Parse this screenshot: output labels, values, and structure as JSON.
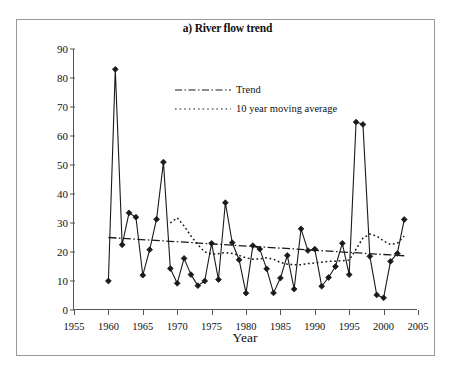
{
  "chart_data": {
    "type": "line",
    "title": "a) River flow trend",
    "xlabel": "Year",
    "ylabel_html": "River flows (m<sup>3</sup> s<sup>-1</sup>)",
    "ylabel": "River flows (m3 s-1)",
    "xlim": [
      1955,
      2005
    ],
    "ylim": [
      0,
      90
    ],
    "xticks": [
      1955,
      1960,
      1965,
      1970,
      1975,
      1980,
      1985,
      1990,
      1995,
      2000,
      2005
    ],
    "yticks": [
      0,
      10,
      20,
      30,
      40,
      50,
      60,
      70,
      80,
      90
    ],
    "grid": false,
    "legend_position": "upper-center",
    "legend": [
      {
        "label": "Trend",
        "style": "dash-dot"
      },
      {
        "label": "10 year moving average",
        "style": "dotted"
      }
    ],
    "series": [
      {
        "name": "River flows",
        "style": "solid-with-diamond-markers",
        "marker": "diamond",
        "x": [
          1960,
          1961,
          1962,
          1963,
          1964,
          1965,
          1966,
          1967,
          1968,
          1969,
          1970,
          1971,
          1972,
          1973,
          1974,
          1975,
          1976,
          1977,
          1978,
          1979,
          1980,
          1981,
          1982,
          1983,
          1984,
          1985,
          1986,
          1987,
          1988,
          1989,
          1990,
          1991,
          1992,
          1993,
          1994,
          1995,
          1996,
          1997,
          1998,
          1999,
          2000,
          2001,
          2002,
          2003
        ],
        "values": [
          10.0,
          83.0,
          22.5,
          33.5,
          32.0,
          12.0,
          20.8,
          31.3,
          51.0,
          14.3,
          9.2,
          17.8,
          12.2,
          8.4,
          10.0,
          23.0,
          10.5,
          37.0,
          23.2,
          17.3,
          5.8,
          22.2,
          21.0,
          14.2,
          5.9,
          11.0,
          18.8,
          7.2,
          28.0,
          20.5,
          21.0,
          8.2,
          11.2,
          15.0,
          23.0,
          12.2,
          64.8,
          64.0,
          18.5,
          5.2,
          4.2,
          16.8,
          19.5,
          31.2
        ]
      },
      {
        "name": "Trend",
        "style": "dash-dot",
        "x": [
          1960,
          2003
        ],
        "values": [
          25.0,
          18.7
        ]
      },
      {
        "name": "10 year moving average",
        "style": "dotted",
        "x": [
          1969,
          1970,
          1971,
          1972,
          1973,
          1974,
          1975,
          1976,
          1977,
          1978,
          1979,
          1980,
          1981,
          1982,
          1983,
          1984,
          1985,
          1986,
          1987,
          1988,
          1989,
          1990,
          1991,
          1992,
          1993,
          1994,
          1995,
          1996,
          1997,
          1998,
          1999,
          2000,
          2001,
          2002,
          2003
        ],
        "values": [
          30.0,
          31.8,
          29.0,
          25.5,
          22.5,
          20.0,
          19.3,
          19.4,
          19.8,
          19.5,
          18.8,
          18.0,
          17.5,
          17.6,
          18.0,
          17.5,
          16.4,
          15.8,
          15.6,
          15.6,
          16.0,
          16.2,
          16.5,
          16.8,
          16.8,
          17.0,
          17.2,
          21.0,
          24.8,
          26.2,
          25.5,
          23.8,
          22.6,
          23.0,
          25.5
        ]
      }
    ]
  },
  "colors": {
    "axis": "#555555",
    "data_line": "#1a1a1a",
    "frame": "#9a9a9a"
  }
}
